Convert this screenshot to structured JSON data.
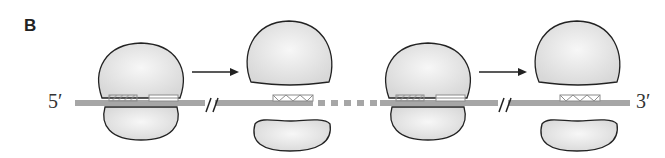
{
  "panel": {
    "label": "B"
  },
  "mrna": {
    "five_prime_label": "5′",
    "three_prime_label": "3′",
    "color": "#a6a6a6"
  },
  "colors": {
    "subunit_fill": "#e4e4e4",
    "subunit_stroke": "#222222",
    "box_stroke": "#8c8c8c",
    "arrow": "#222222"
  },
  "ribosomes": [
    {
      "state": "assembled",
      "boxes": [
        "hatched-site",
        "lined-site"
      ]
    },
    {
      "state": "dissociated",
      "boxes": [
        "triangle-site"
      ]
    },
    {
      "state": "assembled",
      "boxes": [
        "hatched-site",
        "lined-site"
      ]
    },
    {
      "state": "dissociated",
      "boxes": [
        "triangle-site"
      ]
    }
  ],
  "arrows": [
    {
      "from": "ribosome-1",
      "to": "ribosome-2"
    },
    {
      "from": "ribosome-3",
      "to": "ribosome-4"
    }
  ]
}
